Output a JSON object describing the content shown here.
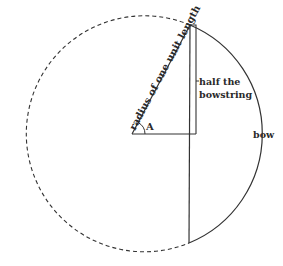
{
  "diagram": {
    "labels": {
      "radius": "radius of one unit length",
      "half_bowstring_line1": "half the",
      "half_bowstring_line2": "bowstring",
      "bow": "bow",
      "angle": "A"
    },
    "colors": {
      "stroke": "#333333",
      "text": "#2a2a2a",
      "background": "#ffffff"
    }
  }
}
